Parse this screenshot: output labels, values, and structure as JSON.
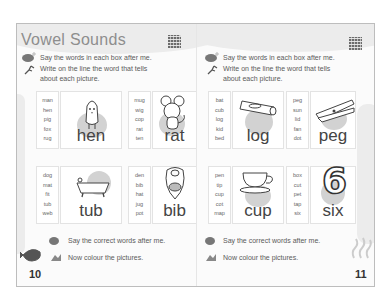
{
  "left_page": {
    "title": "Vowel Sounds",
    "instruction_say": "Say the words in each box after me.",
    "instruction_write_1": "Write on the line the word that tells",
    "instruction_write_2": "about each picture.",
    "items": [
      {
        "words": [
          "man",
          "hen",
          "pig",
          "fox",
          "rug"
        ],
        "picture": "chick-icon",
        "answer": "hen"
      },
      {
        "words": [
          "mug",
          "wig",
          "cop",
          "rat",
          "ten"
        ],
        "picture": "mouse-icon",
        "answer": "rat"
      },
      {
        "words": [
          "dog",
          "mat",
          "fit",
          "tub",
          "web"
        ],
        "picture": "bathtub-icon",
        "answer": "tub"
      },
      {
        "words": [
          "den",
          "bib",
          "hat",
          "jug",
          "pot"
        ],
        "picture": "bib-icon",
        "answer": "bib"
      }
    ],
    "footer_say": "Say the correct words after me.",
    "footer_colour": "Now colour the pictures.",
    "page_number": "10"
  },
  "right_page": {
    "instruction_say": "Say the words in each box after me.",
    "instruction_write_1": "Write on the line the word that tells",
    "instruction_write_2": "about each picture.",
    "items": [
      {
        "words": [
          "bat",
          "cub",
          "log",
          "kid",
          "bed"
        ],
        "picture": "log-icon",
        "answer": "log"
      },
      {
        "words": [
          "peg",
          "sun",
          "lid",
          "fan",
          "dot"
        ],
        "picture": "clothes-peg-icon",
        "answer": "peg"
      },
      {
        "words": [
          "pen",
          "tip",
          "cup",
          "cot",
          "map"
        ],
        "picture": "teacup-icon",
        "answer": "cup"
      },
      {
        "words": [
          "box",
          "cut",
          "pet",
          "tap",
          "six"
        ],
        "picture": "number-six-icon",
        "answer": "six"
      }
    ],
    "footer_say": "Say the correct words after me.",
    "footer_colour": "Now colour the pictures.",
    "page_number": "11"
  },
  "colors": {
    "frame": "#bdbdbd",
    "title": "#8e8e8e",
    "text": "#5a5a5a",
    "blob": "#d2d2d2"
  }
}
